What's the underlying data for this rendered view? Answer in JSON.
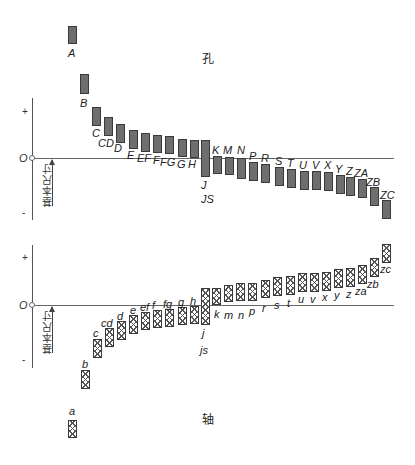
{
  "titles": {
    "hole": "孔",
    "shaft": "轴"
  },
  "axis": {
    "plus": "+",
    "minus": "-",
    "zero": "O",
    "basic_size": "基本尺寸"
  },
  "hole_bars": [
    {
      "label": "A",
      "x": 68,
      "top": 26,
      "h": 18,
      "lx": 68,
      "ly": 48
    },
    {
      "label": "B",
      "x": 80,
      "top": 74,
      "h": 20,
      "lx": 80,
      "ly": 98
    },
    {
      "label": "C",
      "x": 92,
      "top": 107,
      "h": 19,
      "lx": 92,
      "ly": 128
    },
    {
      "label": "CD",
      "x": 104,
      "top": 117,
      "h": 19,
      "lx": 98,
      "ly": 138
    },
    {
      "label": "D",
      "x": 116,
      "top": 124,
      "h": 19,
      "lx": 114,
      "ly": 143
    },
    {
      "label": "E",
      "x": 129,
      "top": 130,
      "h": 19,
      "lx": 127,
      "ly": 150
    },
    {
      "label": "EF",
      "x": 141,
      "top": 133,
      "h": 19,
      "lx": 137,
      "ly": 153
    },
    {
      "label": "F",
      "x": 153,
      "top": 135,
      "h": 18,
      "lx": 153,
      "ly": 155
    },
    {
      "label": "FG",
      "x": 165,
      "top": 136,
      "h": 18,
      "lx": 160,
      "ly": 157
    },
    {
      "label": "G",
      "x": 178,
      "top": 139,
      "h": 18,
      "lx": 177,
      "ly": 159
    },
    {
      "label": "H",
      "x": 190,
      "top": 140,
      "h": 18,
      "lx": 188,
      "ly": 159
    },
    {
      "label": "J",
      "x": 201,
      "top": 140,
      "h": 37,
      "lx": 201,
      "ly": 180
    },
    {
      "label": "JS",
      "x": 201,
      "top": 140,
      "h": 0,
      "lx": 201,
      "ly": 194
    },
    {
      "label": "K",
      "x": 213,
      "top": 156,
      "h": 18,
      "lx": 212,
      "ly": 145
    },
    {
      "label": "M",
      "x": 225,
      "top": 157,
      "h": 18,
      "lx": 223,
      "ly": 145
    },
    {
      "label": "N",
      "x": 237,
      "top": 158,
      "h": 21,
      "lx": 237,
      "ly": 145
    },
    {
      "label": "P",
      "x": 249,
      "top": 162,
      "h": 19,
      "lx": 249,
      "ly": 151
    },
    {
      "label": "R",
      "x": 261,
      "top": 164,
      "h": 19,
      "lx": 261,
      "ly": 153
    },
    {
      "label": "S",
      "x": 275,
      "top": 167,
      "h": 19,
      "lx": 275,
      "ly": 156
    },
    {
      "label": "T",
      "x": 287,
      "top": 169,
      "h": 19,
      "lx": 287,
      "ly": 158
    },
    {
      "label": "U",
      "x": 300,
      "top": 171,
      "h": 19,
      "lx": 299,
      "ly": 160
    },
    {
      "label": "V",
      "x": 312,
      "top": 171,
      "h": 19,
      "lx": 312,
      "ly": 160
    },
    {
      "label": "X",
      "x": 324,
      "top": 172,
      "h": 19,
      "lx": 324,
      "ly": 160
    },
    {
      "label": "Y",
      "x": 336,
      "top": 175,
      "h": 19,
      "lx": 335,
      "ly": 164
    },
    {
      "label": "Z",
      "x": 346,
      "top": 177,
      "h": 19,
      "lx": 346,
      "ly": 166
    },
    {
      "label": "ZA",
      "x": 358,
      "top": 179,
      "h": 19,
      "lx": 354,
      "ly": 168
    },
    {
      "label": "ZB",
      "x": 370,
      "top": 187,
      "h": 19,
      "lx": 366,
      "ly": 177
    },
    {
      "label": "ZC",
      "x": 382,
      "top": 200,
      "h": 19,
      "lx": 380,
      "ly": 190
    }
  ],
  "shaft_bars": [
    {
      "label": "a",
      "x": 68,
      "top": 420,
      "h": 18,
      "lx": 69,
      "ly": 406
    },
    {
      "label": "b",
      "x": 81,
      "top": 370,
      "h": 19,
      "lx": 82,
      "ly": 359
    },
    {
      "label": "c",
      "x": 93,
      "top": 339,
      "h": 19,
      "lx": 93,
      "ly": 328
    },
    {
      "label": "cd",
      "x": 105,
      "top": 328,
      "h": 19,
      "lx": 101,
      "ly": 318
    },
    {
      "label": "d",
      "x": 117,
      "top": 321,
      "h": 19,
      "lx": 117,
      "ly": 311
    },
    {
      "label": "e",
      "x": 129,
      "top": 315,
      "h": 19,
      "lx": 130,
      "ly": 305
    },
    {
      "label": "ef",
      "x": 141,
      "top": 312,
      "h": 18,
      "lx": 140,
      "ly": 302
    },
    {
      "label": "f",
      "x": 153,
      "top": 310,
      "h": 18,
      "lx": 152,
      "ly": 300
    },
    {
      "label": "fg",
      "x": 165,
      "top": 309,
      "h": 18,
      "lx": 163,
      "ly": 299
    },
    {
      "label": "g",
      "x": 178,
      "top": 307,
      "h": 18,
      "lx": 178,
      "ly": 297
    },
    {
      "label": "h",
      "x": 190,
      "top": 306,
      "h": 18,
      "lx": 190,
      "ly": 296
    },
    {
      "label": "j",
      "x": 201,
      "top": 288,
      "h": 37,
      "lx": 202,
      "ly": 328
    },
    {
      "label": "js",
      "x": 201,
      "top": 288,
      "h": 0,
      "lx": 200,
      "ly": 345
    },
    {
      "label": "k",
      "x": 212,
      "top": 288,
      "h": 17,
      "lx": 214,
      "ly": 309
    },
    {
      "label": "m",
      "x": 224,
      "top": 285,
      "h": 17,
      "lx": 224,
      "ly": 310
    },
    {
      "label": "n",
      "x": 236,
      "top": 283,
      "h": 18,
      "lx": 238,
      "ly": 310
    },
    {
      "label": "p",
      "x": 248,
      "top": 283,
      "h": 18,
      "lx": 249,
      "ly": 306
    },
    {
      "label": "r",
      "x": 261,
      "top": 280,
      "h": 18,
      "lx": 262,
      "ly": 303
    },
    {
      "label": "s",
      "x": 273,
      "top": 277,
      "h": 19,
      "lx": 274,
      "ly": 300
    },
    {
      "label": "t",
      "x": 286,
      "top": 276,
      "h": 19,
      "lx": 287,
      "ly": 298
    },
    {
      "label": "u",
      "x": 298,
      "top": 273,
      "h": 19,
      "lx": 298,
      "ly": 294
    },
    {
      "label": "v",
      "x": 310,
      "top": 273,
      "h": 19,
      "lx": 310,
      "ly": 294
    },
    {
      "label": "x",
      "x": 322,
      "top": 272,
      "h": 19,
      "lx": 322,
      "ly": 292
    },
    {
      "label": "y",
      "x": 334,
      "top": 269,
      "h": 19,
      "lx": 334,
      "ly": 290
    },
    {
      "label": "z",
      "x": 346,
      "top": 268,
      "h": 19,
      "lx": 346,
      "ly": 289
    },
    {
      "label": "za",
      "x": 358,
      "top": 265,
      "h": 19,
      "lx": 355,
      "ly": 286
    },
    {
      "label": "zb",
      "x": 370,
      "top": 258,
      "h": 19,
      "lx": 367,
      "ly": 279
    },
    {
      "label": "zc",
      "x": 382,
      "top": 244,
      "h": 19,
      "lx": 380,
      "ly": 264
    }
  ]
}
